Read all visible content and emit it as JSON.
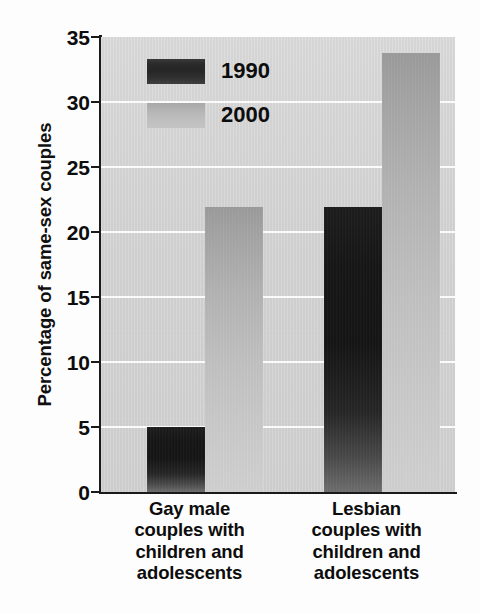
{
  "chart_data": {
    "type": "bar",
    "title": "",
    "subtitle": "",
    "xlabel": "",
    "ylabel": "Percentage of same-sex couples",
    "categories": [
      "Gay male couples with children and adolescents",
      "Lesbian couples with children and adolescents"
    ],
    "category_lines": [
      [
        "Gay male",
        "couples with",
        "children and",
        "adolescents"
      ],
      [
        "Lesbian",
        "couples with",
        "children and",
        "adolescents"
      ]
    ],
    "series": [
      {
        "name": "1990",
        "values": [
          5.0,
          21.9
        ],
        "color": "#1a1a1a"
      },
      {
        "name": "2000",
        "values": [
          21.9,
          33.8
        ],
        "color": "#b8b8b8"
      }
    ],
    "ylim": [
      0,
      35
    ],
    "ytick_values": [
      0,
      5,
      10,
      15,
      20,
      25,
      30,
      35
    ],
    "ytick_labels": [
      "0",
      "5",
      "10",
      "15",
      "20",
      "25",
      "30",
      "35"
    ],
    "grid": "horizontal",
    "gridline_color": "#fbfbfb",
    "legend_position": "upper-left-inside",
    "plot_background": "#d4d4d4",
    "annotations": []
  },
  "legend": {
    "entries": [
      {
        "label": "1990",
        "swatch": "legend-swatch-1990"
      },
      {
        "label": "2000",
        "swatch": "legend-swatch-2000"
      }
    ]
  },
  "axis": {
    "y_title": "Percentage of same-sex couples",
    "y_ticks": [
      "35",
      "30",
      "25",
      "20",
      "15",
      "10",
      "5",
      "0"
    ]
  }
}
